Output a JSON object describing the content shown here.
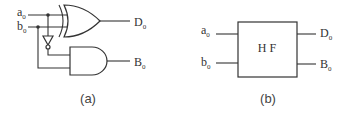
{
  "figure_a": {
    "caption": "(a)",
    "inputs": [
      {
        "name": "a",
        "subscript": "0"
      },
      {
        "name": "b",
        "subscript": "0"
      }
    ],
    "outputs": [
      {
        "name": "D",
        "subscript": "0",
        "gate": "XOR"
      },
      {
        "name": "B",
        "subscript": "0",
        "gate": "AND"
      }
    ],
    "gates": [
      "XOR",
      "NOT",
      "AND"
    ]
  },
  "figure_b": {
    "caption": "(b)",
    "block_label": "H F",
    "inputs": [
      {
        "name": "a",
        "subscript": "0"
      },
      {
        "name": "b",
        "subscript": "0"
      }
    ],
    "outputs": [
      {
        "name": "D",
        "subscript": "0"
      },
      {
        "name": "B",
        "subscript": "0"
      }
    ]
  }
}
